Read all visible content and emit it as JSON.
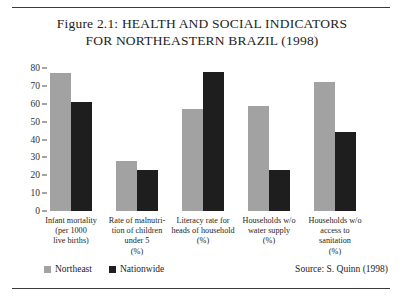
{
  "figure": {
    "title_lines": [
      "Figure 2.1: HEALTH AND SOCIAL INDICATORS",
      "FOR NORTHEASTERN BRAZIL (1998)"
    ],
    "source": "Source: S. Quinn (1998)"
  },
  "legend": {
    "northeast_label": "Northeast",
    "nationwide_label": "Nationwide",
    "northeast_color": "#a2a2a2",
    "nationwide_color": "#1e1e1e"
  },
  "chart_data": {
    "type": "bar",
    "title": "Figure 2.1: HEALTH AND SOCIAL INDICATORS FOR NORTHEASTERN BRAZIL (1998)",
    "xlabel": "",
    "ylabel": "",
    "ylim": [
      0,
      80
    ],
    "yticks": [
      0,
      10,
      20,
      30,
      40,
      50,
      60,
      70,
      80
    ],
    "ytick_labels": [
      "0",
      "10",
      "20",
      "30",
      "40",
      "50",
      "60",
      "70",
      "80"
    ],
    "grid": false,
    "legend_position": "bottom-left",
    "categories": [
      "Infant mortality (per 1000 live births)",
      "Rate of malnutrition of children under 5 (%)",
      "Literacy rate for heads of household (%)",
      "Households w/o water supply (%)",
      "Households w/o access to sanitation (%)"
    ],
    "category_label_lines": [
      [
        "Infant mortality",
        "(per 1000",
        "live births)"
      ],
      [
        "Rate of malnutri-",
        "tion of children",
        "under 5",
        "(%)"
      ],
      [
        "Literacy rate for",
        "heads of household",
        "(%)"
      ],
      [
        "Households w/o",
        "water supply",
        "(%)"
      ],
      [
        "Households w/o",
        "access to",
        "sanitation",
        "(%)"
      ]
    ],
    "series": [
      {
        "name": "Northeast",
        "color": "#a2a2a2",
        "values": [
          77,
          28,
          57,
          59,
          72
        ]
      },
      {
        "name": "Nationwide",
        "color": "#1e1e1e",
        "values": [
          61,
          23,
          78,
          23,
          44
        ]
      }
    ]
  }
}
